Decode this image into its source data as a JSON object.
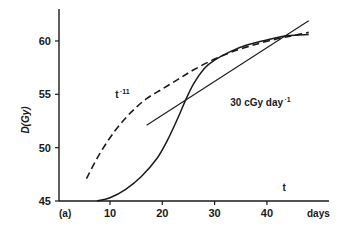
{
  "chart_data": {
    "type": "line",
    "panel_label": "(a)",
    "title": "",
    "xlabel": "days",
    "ylabel": "D(Gy)",
    "xlim": [
      0,
      52
    ],
    "ylim": [
      45,
      63.5
    ],
    "x_ticks": [
      10,
      20,
      30,
      40
    ],
    "y_ticks": [
      45,
      50,
      55,
      60
    ],
    "grid": false,
    "legend": "none",
    "annotations": [
      {
        "text": "t",
        "superscript": "-11",
        "x": 11,
        "y": 54.7
      },
      {
        "text": "30 cGy day",
        "superscript": "-1",
        "x": 33,
        "y": 53.9
      },
      {
        "text": "t",
        "superscript": "",
        "x": 43,
        "y": 45.9
      }
    ],
    "series": [
      {
        "name": "sigmoid (solid)",
        "style": "solid",
        "x": [
          7.5,
          10,
          13,
          16,
          19,
          21,
          23,
          24.5,
          26,
          28,
          30,
          33,
          36,
          40,
          44,
          48
        ],
        "y": [
          45.0,
          45.3,
          46.1,
          47.3,
          49.0,
          50.7,
          52.8,
          54.5,
          56.0,
          57.4,
          58.2,
          59.0,
          59.6,
          60.1,
          60.5,
          60.6
        ]
      },
      {
        "name": "t^-11 (dashed)",
        "style": "dashed",
        "x": [
          5.5,
          8,
          11,
          14,
          17,
          20,
          23,
          26,
          30,
          34,
          38,
          42,
          45,
          48
        ],
        "y": [
          47.1,
          49.4,
          51.6,
          53.3,
          54.6,
          55.5,
          56.4,
          57.3,
          58.3,
          59.1,
          59.7,
          60.2,
          60.5,
          60.8
        ]
      },
      {
        "name": "30 cGy day^-1 (straight)",
        "style": "solid-thin",
        "x": [
          17,
          48
        ],
        "y": [
          52.1,
          61.9
        ]
      }
    ]
  }
}
